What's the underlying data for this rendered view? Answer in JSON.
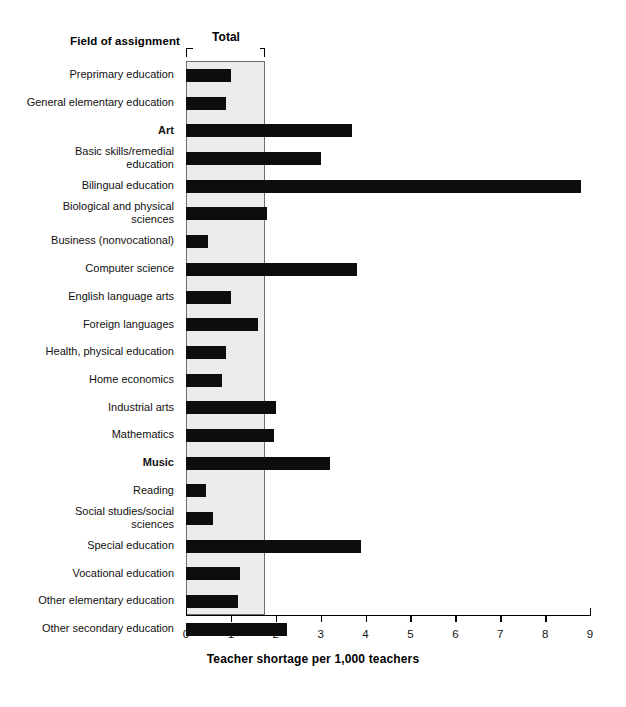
{
  "header": {
    "field_header": "Field of assignment",
    "total_label": "Total"
  },
  "axis": {
    "x_title": "Teacher shortage per 1,000 teachers",
    "ticks": [
      "0",
      "1",
      "2",
      "3",
      "4",
      "5",
      "6",
      "7",
      "8",
      "9"
    ]
  },
  "chart_data": {
    "type": "bar",
    "orientation": "horizontal",
    "title": "",
    "xlabel": "Teacher shortage per 1,000 teachers",
    "ylabel": "Field of assignment",
    "xlim": [
      0,
      9
    ],
    "xticks": [
      0,
      1,
      2,
      3,
      4,
      5,
      6,
      7,
      8,
      9
    ],
    "grid": false,
    "legend": null,
    "total_reference": 1.74,
    "total_band_label": "Total",
    "categories": [
      "Preprimary education",
      "General elementary education",
      "Art",
      "Basic skills/remedial\neducation",
      "Bilingual education",
      "Biological and physical\nsciences",
      "Business (nonvocational)",
      "Computer science",
      "English language arts",
      "Foreign languages",
      "Health, physical education",
      "Home economics",
      "Industrial arts",
      "Mathematics",
      "Music",
      "Reading",
      "Social studies/social\nsciences",
      "Special education",
      "Vocational education",
      "Other elementary education",
      "Other secondary education"
    ],
    "values": [
      1.0,
      0.9,
      3.7,
      3.0,
      8.8,
      1.8,
      0.5,
      3.8,
      1.0,
      1.6,
      0.9,
      0.8,
      2.0,
      1.95,
      3.2,
      0.45,
      0.6,
      3.9,
      1.2,
      1.15,
      2.25
    ],
    "emphasized_categories": [
      "Art",
      "Music"
    ],
    "bar_color": "#0d0d0d",
    "band_color": "#ececec"
  },
  "rows": [
    {
      "label": "Preprimary education",
      "value": 1.0,
      "bold": false,
      "two_line": false
    },
    {
      "label": "General elementary education",
      "value": 0.9,
      "bold": false,
      "two_line": false
    },
    {
      "label": "Art",
      "value": 3.7,
      "bold": true,
      "two_line": false
    },
    {
      "label": "Basic skills/remedial\neducation",
      "value": 3.0,
      "bold": false,
      "two_line": true
    },
    {
      "label": "Bilingual education",
      "value": 8.8,
      "bold": false,
      "two_line": false
    },
    {
      "label": "Biological and physical\nsciences",
      "value": 1.8,
      "bold": false,
      "two_line": true
    },
    {
      "label": "Business (nonvocational)",
      "value": 0.5,
      "bold": false,
      "two_line": false
    },
    {
      "label": "Computer science",
      "value": 3.8,
      "bold": false,
      "two_line": false
    },
    {
      "label": "English language arts",
      "value": 1.0,
      "bold": false,
      "two_line": false
    },
    {
      "label": "Foreign languages",
      "value": 1.6,
      "bold": false,
      "two_line": false
    },
    {
      "label": "Health, physical education",
      "value": 0.9,
      "bold": false,
      "two_line": false
    },
    {
      "label": "Home economics",
      "value": 0.8,
      "bold": false,
      "two_line": false
    },
    {
      "label": "Industrial arts",
      "value": 2.0,
      "bold": false,
      "two_line": false
    },
    {
      "label": "Mathematics",
      "value": 1.95,
      "bold": false,
      "two_line": false
    },
    {
      "label": "Music",
      "value": 3.2,
      "bold": true,
      "two_line": false
    },
    {
      "label": "Reading",
      "value": 0.45,
      "bold": false,
      "two_line": false
    },
    {
      "label": "Social studies/social\nsciences",
      "value": 0.6,
      "bold": false,
      "two_line": true
    },
    {
      "label": "Special education",
      "value": 3.9,
      "bold": false,
      "two_line": false
    },
    {
      "label": "Vocational education",
      "value": 1.2,
      "bold": false,
      "two_line": false
    },
    {
      "label": "Other elementary education",
      "value": 1.15,
      "bold": false,
      "two_line": false
    },
    {
      "label": "Other secondary education",
      "value": 2.25,
      "bold": false,
      "two_line": false
    }
  ]
}
